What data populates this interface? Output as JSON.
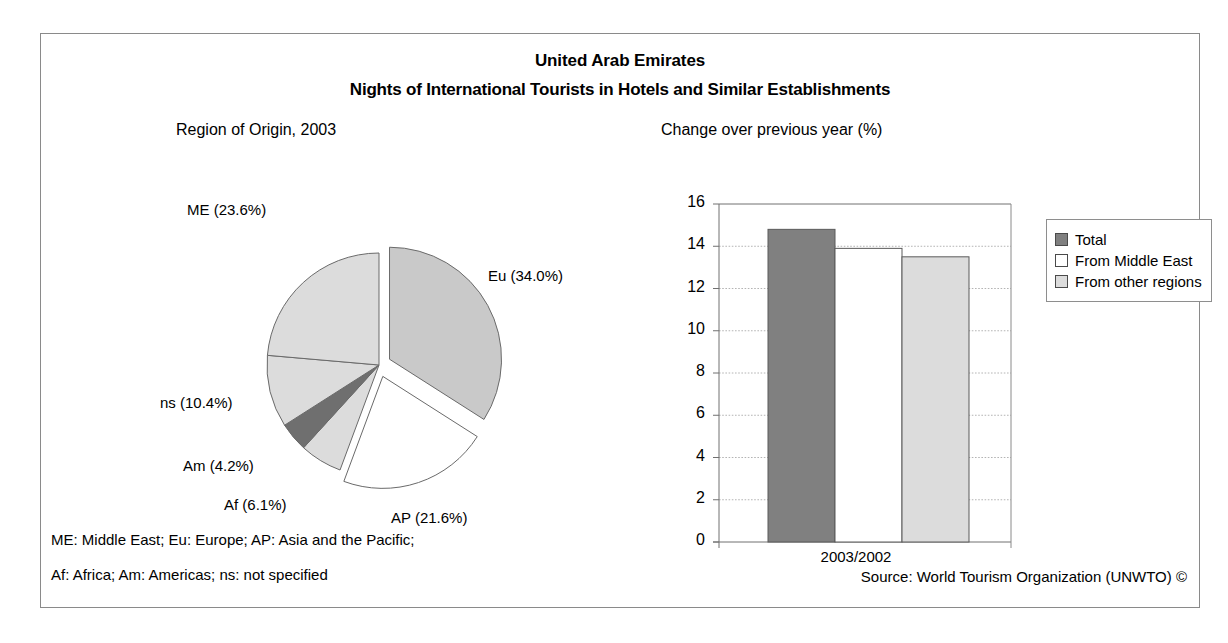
{
  "header": {
    "country": "United Arab Emirates",
    "subtitle": "Nights of International Tourists in Hotels and Similar Establishments"
  },
  "pie_panel": {
    "title": "Region of Origin, 2003"
  },
  "bar_panel": {
    "title": "Change over previous year (%)"
  },
  "footer": {
    "note_line_1": "ME: Middle East; Eu: Europe; AP: Asia and the Pacific;",
    "note_line_2": "Af: Africa; Am: Americas; ns: not specified",
    "source": "Source: World Tourism Organization (UNWTO) ©"
  },
  "colors": {
    "frame_border": "#8a8a8a",
    "slice_eu": "#c9c9c9",
    "slice_ap": "#ffffff",
    "slice_af": "#dcdcdc",
    "slice_am": "#6f6f6f",
    "slice_ns": "#dcdcdc",
    "slice_me": "#dcdcdc",
    "bar_total": "#808080",
    "bar_middle_east": "#ffffff",
    "bar_other_regions": "#dcdcdc",
    "gridline": "#b0b0b0",
    "axis": "#707070"
  },
  "chart_data": [
    {
      "type": "pie",
      "title": "Region of Origin, 2003",
      "unit": "%",
      "labels": [
        "Eu (34.0%)",
        "AP (21.6%)",
        "Af (6.1%)",
        "Am (4.2%)",
        "ns (10.4%)",
        "ME (23.6%)"
      ],
      "categories": [
        "Eu",
        "AP",
        "Af",
        "Am",
        "ns",
        "ME"
      ],
      "category_names": [
        "Europe",
        "Asia and the Pacific",
        "Africa",
        "Americas",
        "not specified",
        "Middle East"
      ],
      "values": [
        34.0,
        21.6,
        6.1,
        4.2,
        10.4,
        23.6
      ],
      "fills": [
        "#c9c9c9",
        "#ffffff",
        "#dcdcdc",
        "#6f6f6f",
        "#dcdcdc",
        "#dcdcdc"
      ],
      "exploded": [
        true,
        true,
        false,
        false,
        false,
        false
      ],
      "start_angle_deg": 0,
      "direction": "clockwise",
      "legend": "none"
    },
    {
      "type": "bar",
      "title": "Change over previous year (%)",
      "categories": [
        "2003/2002"
      ],
      "xlabel": "",
      "ylabel": "",
      "ylim": [
        0,
        16
      ],
      "yticks": [
        0,
        2,
        4,
        6,
        8,
        10,
        12,
        14,
        16
      ],
      "ytick_labels": [
        "0",
        "2",
        "4",
        "6",
        "8",
        "10",
        "12",
        "14",
        "16"
      ],
      "grid": true,
      "legend_position": "right",
      "series": [
        {
          "name": "Total",
          "values": [
            14.8
          ],
          "fill": "#808080"
        },
        {
          "name": "From Middle East",
          "values": [
            13.9
          ],
          "fill": "#ffffff"
        },
        {
          "name": "From other regions",
          "values": [
            13.5
          ],
          "fill": "#dcdcdc"
        }
      ]
    }
  ]
}
